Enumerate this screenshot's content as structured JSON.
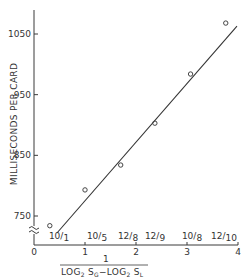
{
  "chart_data": {
    "type": "scatter",
    "title": "",
    "xlabel": "1 / (LOG2 SG - LOG2 SL)",
    "xlabel_numerator": "1",
    "xlabel_denominator": "LOG₂ Sᴳ − LOG₂ Sʟ",
    "ylabel": "MILLISECONDS PER CARD",
    "xlim": [
      0,
      4
    ],
    "ylim": [
      700,
      1080
    ],
    "y_axis_break": true,
    "x_ticks": [
      "0",
      "1",
      "2",
      "3",
      "4"
    ],
    "y_ticks": [
      "750",
      "850",
      "950",
      "1050"
    ],
    "grid": false,
    "legend": null,
    "series": [
      {
        "name": "observed",
        "marker": "open-circle",
        "points": [
          {
            "x": 0.31,
            "y": 734,
            "label": "10/1"
          },
          {
            "x": 1.0,
            "y": 793,
            "label": "10/5"
          },
          {
            "x": 1.7,
            "y": 834,
            "label": "12/8"
          },
          {
            "x": 2.37,
            "y": 903,
            "label": "12/9"
          },
          {
            "x": 3.07,
            "y": 984,
            "label": "10/8"
          },
          {
            "x": 3.76,
            "y": 1068,
            "label": "12/10"
          }
        ]
      },
      {
        "name": "fit",
        "type": "line",
        "points": [
          {
            "x": 0.45,
            "y": 722
          },
          {
            "x": 3.98,
            "y": 1063
          }
        ]
      }
    ],
    "annotations": [
      "10/1",
      "10/5",
      "12/8",
      "12/9",
      "10/8",
      "12/10"
    ]
  },
  "labels": {
    "ylabel": "MILLISECONDS PER CARD",
    "x_num": "1",
    "x_den_log1": "LOG",
    "x_den_sub1": "2",
    "x_den_s1": " S",
    "x_den_subG": "G",
    "x_den_minus": "−LOG",
    "x_den_sub2": "2",
    "x_den_s2": " S",
    "x_den_subL": "L"
  }
}
